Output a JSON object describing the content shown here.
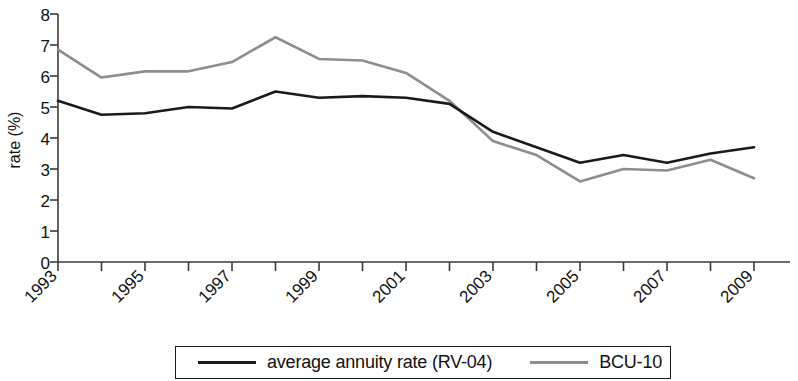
{
  "chart_data": {
    "type": "line",
    "title": "",
    "xlabel": "",
    "ylabel": "rate (%)",
    "ylim": [
      0,
      8
    ],
    "xlim": [
      1993,
      2009
    ],
    "grid": false,
    "legend_position": "bottom",
    "x": [
      1993,
      1994,
      1995,
      1996,
      1997,
      1998,
      1999,
      2000,
      2001,
      2002,
      2003,
      2004,
      2005,
      2006,
      2007,
      2008,
      2009
    ],
    "xtick_labels": [
      "1993",
      "1995",
      "1997",
      "1999",
      "2001",
      "2003",
      "2005",
      "2007",
      "2009"
    ],
    "xtick_values": [
      1993,
      1995,
      1997,
      1999,
      2001,
      2003,
      2005,
      2007,
      2009
    ],
    "ytick_labels": [
      "0",
      "1",
      "2",
      "3",
      "4",
      "5",
      "6",
      "7",
      "8"
    ],
    "ytick_values": [
      0,
      1,
      2,
      3,
      4,
      5,
      6,
      7,
      8
    ],
    "series": [
      {
        "name": "average annuity rate (RV-04)",
        "color": "#1a1a1a",
        "values": [
          5.2,
          4.75,
          4.8,
          5.0,
          4.95,
          5.5,
          5.3,
          5.35,
          5.3,
          5.1,
          4.2,
          3.7,
          3.2,
          3.45,
          3.2,
          3.5,
          3.7
        ]
      },
      {
        "name": "BCU-10",
        "color": "#8d8d8d",
        "values": [
          6.85,
          5.95,
          6.15,
          6.15,
          6.45,
          7.25,
          6.55,
          6.5,
          6.1,
          5.2,
          3.9,
          3.45,
          2.6,
          3.0,
          2.95,
          3.3,
          2.7
        ]
      }
    ]
  },
  "legend": {
    "entries": [
      {
        "label": "average annuity rate (RV-04)",
        "color": "#1a1a1a"
      },
      {
        "label": "BCU-10",
        "color": "#8d8d8d"
      }
    ]
  },
  "axis": {
    "y_title": "rate (%)"
  }
}
